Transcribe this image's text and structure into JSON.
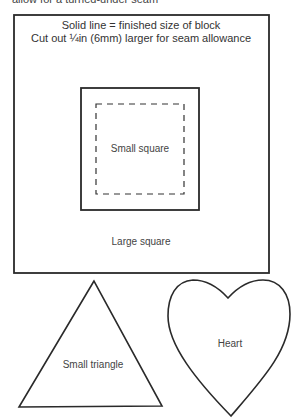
{
  "caption_top": "allow for a turned-under seam",
  "large_square": {
    "note_line1": "Solid line = finished size of block",
    "note_line2": "Cut out ¼in (6mm) larger for seam allowance",
    "label": "Large square"
  },
  "small_square": {
    "label": "Small square"
  },
  "triangle": {
    "label": "Small triangle"
  },
  "heart": {
    "label": "Heart"
  },
  "colors": {
    "stroke": "#2a2a2a",
    "text": "#444444",
    "background": "#ffffff"
  }
}
